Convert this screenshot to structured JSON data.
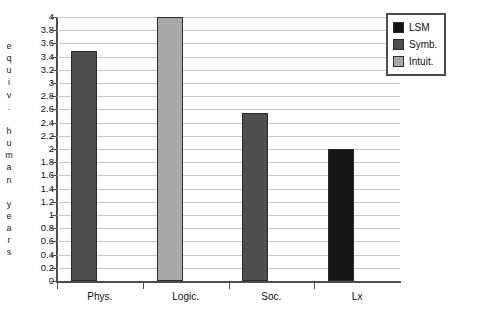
{
  "chart_data": {
    "type": "bar",
    "title": "",
    "xlabel": "",
    "ylabel": "equiv. human years",
    "ylabel_letters": [
      "e",
      "q",
      "u",
      "i",
      "v",
      ".",
      "",
      "h",
      "u",
      "m",
      "a",
      "n",
      "",
      "y",
      "e",
      "a",
      "r",
      "s"
    ],
    "categories": [
      "Phys.",
      "Logic.",
      "Soc.",
      "Lx"
    ],
    "values": [
      3.49,
      4.0,
      2.55,
      2.0
    ],
    "bar_series": [
      "Symb.",
      "Intuit.",
      "Symb.",
      "LSM"
    ],
    "ylim": [
      0,
      4
    ],
    "ytick_step": 0.2,
    "ytick_labels": [
      "4",
      "3.8",
      "3.6",
      "3.4",
      "3.2",
      "3",
      "2.8",
      "2.6",
      "2.4",
      "2.2",
      "2",
      "1.8",
      "1.6",
      "1.4",
      "1.2",
      "1",
      "0.8",
      "0.6",
      "0.4",
      "0.2",
      "0"
    ],
    "grid": true,
    "legend_position": "top-right",
    "legend": [
      {
        "label": "LSM",
        "color": "#151515"
      },
      {
        "label": "Symb.",
        "color": "#4f4f4f"
      },
      {
        "label": "Intuit.",
        "color": "#a8a8a8"
      }
    ],
    "colors": {
      "lsm": "#151515",
      "symb": "#4f4f4f",
      "intuit": "#a8a8a8",
      "gridline": "#c8c8c8",
      "axis": "#4d4d4d",
      "bar_border": "#2b2b2b"
    }
  }
}
